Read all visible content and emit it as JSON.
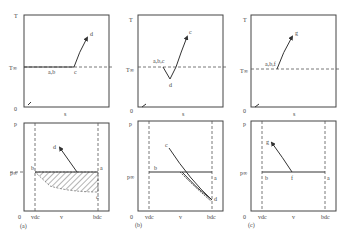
{
  "panels_top": [
    {
      "id": "a",
      "y_axis": "T",
      "ref_line": "T∞",
      "x_axis": "s",
      "origin": "0",
      "points": {
        "start": "a,b",
        "c": "c",
        "d": "d"
      }
    },
    {
      "id": "b",
      "y_axis": "T",
      "ref_line": "T∞",
      "x_axis": "s",
      "origin": "0",
      "points": {
        "start": "a,b,c",
        "d": "d",
        "c": "c"
      }
    },
    {
      "id": "c",
      "y_axis": "T",
      "ref_line": "T∞",
      "x_axis": "s",
      "origin": "0",
      "points": {
        "start": "a,b,f",
        "g": "g"
      }
    }
  ],
  "panels_bottom": [
    {
      "id": "a",
      "caption": "(a)",
      "y_axis": "p",
      "ref_line": "p∞",
      "x_axis": "v",
      "origin": "0",
      "vdc": "vdc",
      "bdc": "bdc",
      "points": {
        "b": "b",
        "a": "a",
        "d": "d",
        "c": "c"
      }
    },
    {
      "id": "b",
      "caption": "(b)",
      "y_axis": "p",
      "ref_line": "p∞",
      "x_axis": "v",
      "origin": "0",
      "vdc": "vdc",
      "bdc": "bdc",
      "points": {
        "b": "b",
        "a": "a",
        "c": "c",
        "d": "d"
      }
    },
    {
      "id": "c",
      "caption": "(c)",
      "y_axis": "p",
      "ref_line": "p∞",
      "x_axis": "v",
      "origin": "0",
      "vdc": "vdc",
      "bdc": "bdc",
      "points": {
        "b": "b",
        "f": "f",
        "a": "a",
        "g": "g"
      }
    }
  ]
}
